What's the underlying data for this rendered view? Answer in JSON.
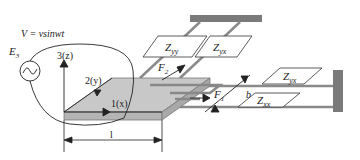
{
  "diagram": {
    "source_label": "V = vsinwt",
    "source_name": "E",
    "source_sub": "3",
    "axes": {
      "z": "3(z)",
      "y": "2(y)",
      "x": "1(x)"
    },
    "length_label": "l",
    "width_label": "b",
    "forces": {
      "f1": "F",
      "f1_sub": "1",
      "f2": "F",
      "f2_sub": "2"
    },
    "impedances": {
      "zyy": "Z",
      "zyy_sub": "yy",
      "zyx_top": "Z",
      "zyx_top_sub": "yx",
      "zyx_right": "Z",
      "zyx_right_sub": "yx",
      "zxx": "Z",
      "zxx_sub": "xx"
    },
    "colors": {
      "plate_top": "#c8c8c8",
      "plate_side": "#b4b4b4",
      "wall": "#7a7a7a",
      "rod": "#8a8a8a",
      "line": "#222222"
    }
  }
}
